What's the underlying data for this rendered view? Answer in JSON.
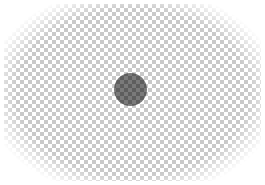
{
  "canvas": {
    "width": 265,
    "height": 185,
    "background": "transparency-checkerboard",
    "checker_light": "#ffffff",
    "checker_dark": "#c9c9c9",
    "checker_cell_px": 4
  },
  "shape": {
    "type": "circle",
    "center_x": 130,
    "center_y": 90,
    "radius": 16,
    "color": "#6b6b6b",
    "semi_transparent": true
  }
}
